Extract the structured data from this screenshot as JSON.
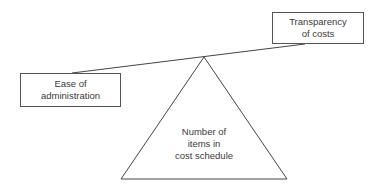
{
  "diagram": {
    "type": "balance-scale",
    "left_box": {
      "lines": [
        "Ease of",
        "administration"
      ]
    },
    "right_box": {
      "lines": [
        "Transparency",
        "of costs"
      ]
    },
    "fulcrum": {
      "lines": [
        "Number of",
        "items in",
        "cost schedule"
      ]
    }
  }
}
